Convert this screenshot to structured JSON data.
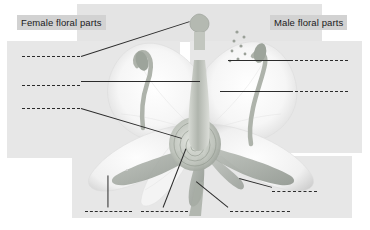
{
  "worksheet": {
    "title_female": "Female floral parts",
    "title_male": "Male floral parts",
    "illustration_name": "flower-cross-section-diagram",
    "colors": {
      "panel_fill": "#e7e7e7",
      "header_chip_fill": "#d2d2d2",
      "line_color": "#2b2b2b",
      "page_background": "#ffffff",
      "petal_light": "#f4f4f4",
      "petal_shadow": "#d8d8d8",
      "pistil_gray": "#b9bdb6",
      "sepal_gray": "#9aa09a"
    }
  },
  "female_section": {
    "label": "Female floral parts",
    "blanks": [
      {
        "id": "female-blank-1",
        "value": "",
        "x": 22,
        "y": 56,
        "width": 58
      },
      {
        "id": "female-blank-2",
        "value": "",
        "x": 22,
        "y": 85,
        "width": 58
      },
      {
        "id": "female-blank-3",
        "value": "",
        "x": 22,
        "y": 108,
        "width": 58
      }
    ]
  },
  "male_section": {
    "label": "Male floral parts",
    "blanks": [
      {
        "id": "male-blank-1",
        "value": "",
        "x": 290,
        "y": 60,
        "width": 58
      },
      {
        "id": "male-blank-2",
        "value": "",
        "x": 290,
        "y": 91,
        "width": 58
      }
    ]
  },
  "bottom_section": {
    "blanks": [
      {
        "id": "bottom-blank-1",
        "value": "",
        "x": 85,
        "y": 211,
        "width": 47
      },
      {
        "id": "bottom-blank-2",
        "value": "",
        "x": 141,
        "y": 211,
        "width": 47
      },
      {
        "id": "bottom-blank-3",
        "value": "",
        "x": 230,
        "y": 211,
        "width": 60
      },
      {
        "id": "bottom-blank-4",
        "value": "",
        "x": 272,
        "y": 191,
        "width": 45
      }
    ]
  },
  "leader_lines": [
    {
      "id": "leader-stigma",
      "x1": 81,
      "y1": 56,
      "x2": 190,
      "y2": 21
    },
    {
      "id": "leader-style",
      "x1": 81,
      "y1": 81,
      "x2": 200,
      "y2": 81
    },
    {
      "id": "leader-ovary",
      "x1": 81,
      "y1": 108,
      "x2": 182,
      "y2": 138
    },
    {
      "id": "leader-anther",
      "x1": 228,
      "y1": 60,
      "x2": 290,
      "y2": 60
    },
    {
      "id": "leader-filament",
      "x1": 220,
      "y1": 91,
      "x2": 290,
      "y2": 91
    },
    {
      "id": "leader-petal",
      "x1": 108,
      "y1": 175,
      "x2": 108,
      "y2": 207
    },
    {
      "id": "leader-receptacle",
      "x1": 163,
      "y1": 207,
      "x2": 186,
      "y2": 148
    },
    {
      "id": "leader-sepal",
      "x1": 228,
      "y1": 207,
      "x2": 196,
      "y2": 181
    },
    {
      "id": "leader-pedicel",
      "x1": 272,
      "y1": 187,
      "x2": 239,
      "y2": 178
    }
  ]
}
